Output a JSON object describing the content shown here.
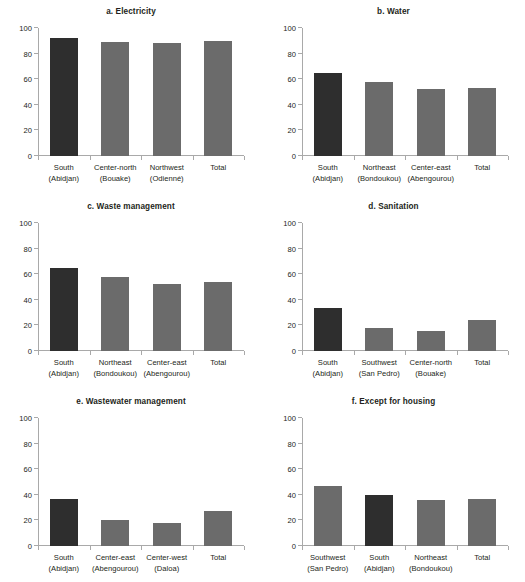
{
  "figure": {
    "width": 525,
    "height": 582,
    "background": "#ffffff",
    "bar_color": "#6b6b6b",
    "highlight_bar_color": "#2e2e2e",
    "axis_color": "#a9a9a9",
    "text_color": "#231f20"
  },
  "chart_data": [
    {
      "type": "bar",
      "title": "a. Electricity",
      "categories": [
        "South\n(Abidjan)",
        "Center-north\n(Bouake)",
        "Northwest\n(Odienné)",
        "Total"
      ],
      "category_lines": [
        [
          "South",
          "(Abidjan)"
        ],
        [
          "Center-north",
          "(Bouake)"
        ],
        [
          "Northwest",
          "(Odienné)"
        ],
        [
          "Total",
          ""
        ]
      ],
      "values": [
        92.5,
        89.0,
        88.5,
        89.5
      ],
      "highlight_index": 0,
      "xlabel": "",
      "ylabel": "",
      "ylim": [
        0,
        100
      ],
      "yticks": [
        0,
        20,
        40,
        60,
        80,
        100
      ],
      "grid": false,
      "legend": "none"
    },
    {
      "type": "bar",
      "title": "b. Water",
      "categories": [
        "South\n(Abidjan)",
        "Northeast\n(Bondoukou)",
        "Center-east\n(Abengourou)",
        "Total"
      ],
      "category_lines": [
        [
          "South",
          "(Abidjan)"
        ],
        [
          "Northeast",
          "(Bondoukou)"
        ],
        [
          "Center-east",
          "(Abengourou)"
        ],
        [
          "Total",
          ""
        ]
      ],
      "values": [
        64.5,
        57.5,
        52.0,
        53.5
      ],
      "highlight_index": 0,
      "xlabel": "",
      "ylabel": "",
      "ylim": [
        0,
        100
      ],
      "yticks": [
        0,
        20,
        40,
        60,
        80,
        100
      ],
      "grid": false,
      "legend": "none"
    },
    {
      "type": "bar",
      "title": "c. Waste management",
      "categories": [
        "South\n(Abidjan)",
        "Northeast\n(Bondoukou)",
        "Center-east\n(Abengourou)",
        "Total"
      ],
      "category_lines": [
        [
          "South",
          "(Abidjan)"
        ],
        [
          "Northeast",
          "(Bondoukou)"
        ],
        [
          "Center-east",
          "(Abengourou)"
        ],
        [
          "Total",
          ""
        ]
      ],
      "values": [
        64.5,
        58.0,
        52.0,
        54.0
      ],
      "highlight_index": 0,
      "xlabel": "",
      "ylabel": "",
      "ylim": [
        0,
        100
      ],
      "yticks": [
        0,
        20,
        40,
        60,
        80,
        100
      ],
      "grid": false,
      "legend": "none"
    },
    {
      "type": "bar",
      "title": "d. Sanitation",
      "categories": [
        "South\n(Abidjan)",
        "Southwest\n(San Pedro)",
        "Center-north\n(Bouake)",
        "Total"
      ],
      "category_lines": [
        [
          "South",
          "(Abidjan)"
        ],
        [
          "Southwest",
          "(San Pedro)"
        ],
        [
          "Center-north",
          "(Bouake)"
        ],
        [
          "Total",
          ""
        ]
      ],
      "values": [
        33.5,
        18.0,
        16.0,
        24.0
      ],
      "highlight_index": 0,
      "xlabel": "",
      "ylabel": "",
      "ylim": [
        0,
        100
      ],
      "yticks": [
        0,
        20,
        40,
        60,
        80,
        100
      ],
      "grid": false,
      "legend": "none"
    },
    {
      "type": "bar",
      "title": "e. Wastewater management",
      "categories": [
        "South\n(Abidjan)",
        "Center-east\n(Abengourou)",
        "Center-west\n(Daloa)",
        "Total"
      ],
      "category_lines": [
        [
          "South",
          "(Abidjan)"
        ],
        [
          "Center-east",
          "(Abengourou)"
        ],
        [
          "Center-west",
          "(Daloa)"
        ],
        [
          "Total",
          ""
        ]
      ],
      "values": [
        36.5,
        20.0,
        18.0,
        27.0
      ],
      "highlight_index": 0,
      "xlabel": "",
      "ylabel": "",
      "ylim": [
        0,
        100
      ],
      "yticks": [
        0,
        20,
        40,
        60,
        80,
        100
      ],
      "grid": false,
      "legend": "none"
    },
    {
      "type": "bar",
      "title": "f. Except for housing",
      "categories": [
        "Southwest\n(San Pedro)",
        "South\n(Abidjan)",
        "Northeast\n(Bondoukou)",
        "Total"
      ],
      "category_lines": [
        [
          "Southwest",
          "(San Pedro)"
        ],
        [
          "South",
          "(Abidjan)"
        ],
        [
          "Northeast",
          "(Bondoukou)"
        ],
        [
          "Total",
          ""
        ]
      ],
      "values": [
        47.0,
        39.5,
        36.0,
        36.5
      ],
      "highlight_index": 1,
      "xlabel": "",
      "ylabel": "",
      "ylim": [
        0,
        100
      ],
      "yticks": [
        0,
        20,
        40,
        60,
        80,
        100
      ],
      "grid": false,
      "legend": "none"
    }
  ]
}
